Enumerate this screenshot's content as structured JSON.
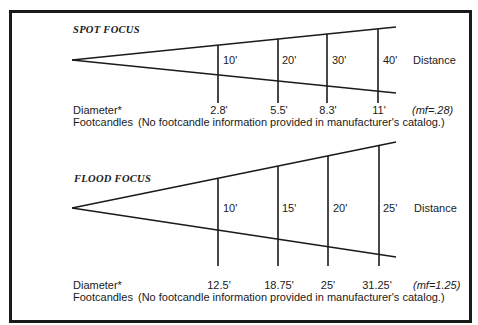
{
  "spot": {
    "title": "SPOT FOCUS",
    "distance_label": "Distance",
    "distances": [
      "10'",
      "20'",
      "30'",
      "40'"
    ],
    "diameter_label": "Diameter*",
    "diameters": [
      "2.8'",
      "5.5'",
      "8.3'",
      "11'"
    ],
    "footcandles_label": "Footcandles",
    "footcandles_note": "(No footcandle information provided in manufacturer's catalog.)",
    "mf": "(mf=.28)"
  },
  "flood": {
    "title": "FLOOD FOCUS",
    "distance_label": "Distance",
    "distances": [
      "10'",
      "15'",
      "20'",
      "25'"
    ],
    "diameter_label": "Diameter*",
    "diameters": [
      "12.5'",
      "18.75'",
      "25'",
      "31.25'"
    ],
    "footcandles_label": "Footcandles",
    "footcandles_note": "(No footcandle information provided in manufacturer's catalog.)",
    "mf": "(mf=1.25)"
  }
}
